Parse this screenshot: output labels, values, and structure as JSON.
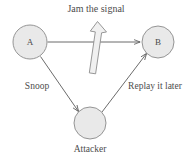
{
  "figure": {
    "title": "Jam the signal",
    "background_color": "#ffffff",
    "node_fill": "#e9e9e9",
    "node_stroke": "#8a8a8a",
    "edge_color": "#5a5a5a",
    "text_color": "#4d4d4d",
    "block_arrow_fill": "#efefef",
    "block_arrow_stroke": "#8a8a8a"
  },
  "nodes": [
    {
      "id": "A",
      "label": "A",
      "label_position": "inside",
      "cx": 30,
      "cy": 42,
      "r": 17
    },
    {
      "id": "B",
      "label": "B",
      "label_position": "inside",
      "cx": 158,
      "cy": 42,
      "r": 16
    },
    {
      "id": "Attacker",
      "label": "Attacker",
      "label_position": "below",
      "cx": 90,
      "cy": 123,
      "r": 16
    }
  ],
  "edges": [
    {
      "id": "a-to-b",
      "from": "A",
      "to": "B",
      "label": "",
      "arrowhead": true
    },
    {
      "id": "a-to-attacker",
      "from": "A",
      "to": "Attacker",
      "label": "Snoop",
      "arrowhead": true
    },
    {
      "id": "attacker-to-b",
      "from": "Attacker",
      "to": "B",
      "label": "Replay it later",
      "arrowhead": true
    }
  ],
  "annotations": {
    "jam_arrow": {
      "name": "jam-block-arrow",
      "direction": "up",
      "description": "hollow block arrow pointing up crossing the A to B link"
    }
  },
  "labels": {
    "title": "Jam the signal",
    "node_a": "A",
    "node_b": "B",
    "node_attacker": "Attacker",
    "edge_snoop": "Snoop",
    "edge_replay": "Replay it later"
  }
}
